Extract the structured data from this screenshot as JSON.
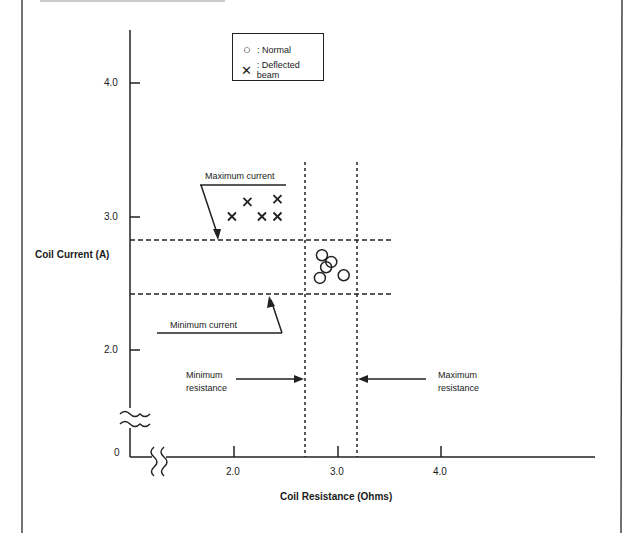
{
  "chart_data": {
    "type": "scatter",
    "title": "",
    "xlabel": "Coil Resistance (Ohms)",
    "ylabel": "Coil Current (A)",
    "x_ticks": [
      "2.0",
      "3.0",
      "4.0"
    ],
    "y_ticks": [
      "0",
      "2.0",
      "3.0",
      "4.0"
    ],
    "axis_breaks": {
      "x": true,
      "y": true
    },
    "grid": false,
    "legend_position": "top-center",
    "legend": [
      {
        "symbol": "circle",
        "label": ": Normal"
      },
      {
        "symbol": "x",
        "label": ": Deflected beam"
      }
    ],
    "series": [
      {
        "name": "Normal",
        "marker": "circle",
        "points": [
          {
            "x": 2.85,
            "y": 2.71
          },
          {
            "x": 2.94,
            "y": 2.66
          },
          {
            "x": 2.89,
            "y": 2.62
          },
          {
            "x": 2.83,
            "y": 2.54
          },
          {
            "x": 3.06,
            "y": 2.56
          }
        ]
      },
      {
        "name": "Deflected beam",
        "marker": "x",
        "points": [
          {
            "x": 1.98,
            "y": 3.0
          },
          {
            "x": 2.13,
            "y": 3.11
          },
          {
            "x": 2.27,
            "y": 3.0
          },
          {
            "x": 2.42,
            "y": 3.0
          },
          {
            "x": 2.42,
            "y": 3.13
          }
        ]
      }
    ],
    "reference_lines": [
      {
        "orientation": "horizontal",
        "value": 2.83,
        "label": "Maximum current",
        "style": "dashed"
      },
      {
        "orientation": "horizontal",
        "value": 2.42,
        "label": "Minimum current",
        "style": "dashed"
      },
      {
        "orientation": "vertical",
        "value": 2.68,
        "label": "Minimum resistance",
        "style": "dashed"
      },
      {
        "orientation": "vertical",
        "value": 3.18,
        "label": "Maximum resistance",
        "style": "dashed"
      }
    ],
    "annotations": {
      "max_current": "Maximum current",
      "min_current": "Minimum current",
      "min_resistance_line1": "Minimum",
      "min_resistance_line2": "resistance",
      "max_resistance_line1": "Maximum",
      "max_resistance_line2": "resistance"
    }
  }
}
